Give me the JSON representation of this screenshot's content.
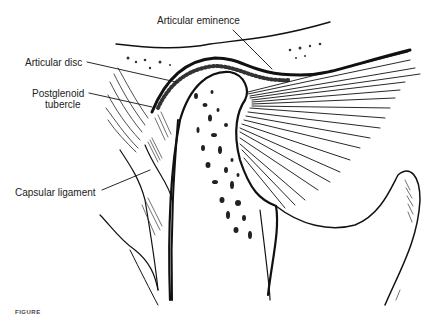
{
  "figure": {
    "labels": [
      {
        "id": "articular-eminence",
        "text": "Articular eminence"
      },
      {
        "id": "articular-disc",
        "text": "Articular disc"
      },
      {
        "id": "postglenoid-tubercle",
        "line1": "Postglenoid",
        "line2": "tubercle"
      },
      {
        "id": "capsular-ligament",
        "text": "Capsular ligament"
      }
    ],
    "caption_fragment": "FIGURE",
    "colors": {
      "ink": "#111111",
      "background": "#ffffff",
      "label_text": "#222222"
    }
  }
}
